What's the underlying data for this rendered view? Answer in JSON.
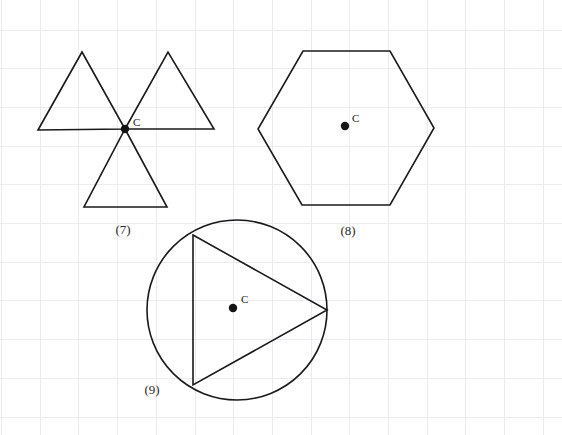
{
  "document": {
    "title": "Geometry Figures 7 8 9",
    "background_color": "#ffffff",
    "width": 562,
    "height": 435
  },
  "grid": {
    "line_color": "#ececf0",
    "spacing_x": 38.7,
    "spacing_y": 38.7,
    "origin_x": 1.5,
    "origin_y": 30.0,
    "visible": true
  },
  "style": {
    "stroke_color": "#1a1a1a",
    "stroke_width": 1.6,
    "dot_color": "#141414",
    "label_color": "#1a1a1a",
    "caption_color": "#2a2a2a"
  },
  "figures": [
    {
      "id": "figure-7",
      "caption": "(7)",
      "caption_x": 123,
      "caption_y": 234,
      "shape_type": "three-triangles-meeting-at-point",
      "center_label": "C",
      "center_label_x": 133,
      "center_label_y": 126,
      "center_dot_x": 125,
      "center_dot_y": 129,
      "center_dot_r": 4.2,
      "triangles": [
        {
          "name": "upper-left-triangle",
          "points": "38,130 82,52 125,129"
        },
        {
          "name": "upper-right-triangle",
          "points": "125,129 168,52 214,129"
        },
        {
          "name": "lower-middle-triangle",
          "points": "125,129 167,207 84,207"
        }
      ]
    },
    {
      "id": "figure-8",
      "caption": "(8)",
      "caption_x": 348,
      "caption_y": 235,
      "shape_type": "regular-hexagon",
      "center_label": "C",
      "center_label_x": 352,
      "center_label_y": 122,
      "center_dot_x": 345,
      "center_dot_y": 126,
      "center_dot_r": 4.2,
      "polygon_points": "303,51 390,51 434,128 390,205 302,205 258,129"
    },
    {
      "id": "figure-9",
      "caption": "(9)",
      "caption_x": 152,
      "caption_y": 394,
      "shape_type": "circle-with-inscribed-triangle",
      "center_label": "C",
      "center_label_x": 241,
      "center_label_y": 303,
      "center_dot_x": 233,
      "center_dot_y": 308,
      "center_dot_r": 4.2,
      "circle_cx": 237,
      "circle_cy": 310,
      "circle_r": 90,
      "triangle_points": "193,235 327,310 193,385"
    }
  ]
}
